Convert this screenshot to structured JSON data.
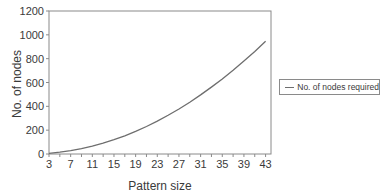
{
  "chart_data": {
    "type": "line",
    "title": "",
    "xlabel": "Pattern size",
    "ylabel": "No. of nodes",
    "x_tick_labels": [
      "3",
      "7",
      "11",
      "15",
      "19",
      "23",
      "27",
      "31",
      "35",
      "39",
      "43"
    ],
    "y_tick_labels": [
      "0",
      "200",
      "400",
      "600",
      "800",
      "1000",
      "1200"
    ],
    "xlim": [
      3,
      44
    ],
    "ylim": [
      0,
      1200
    ],
    "grid": false,
    "legend_position": "right",
    "series": [
      {
        "name": "No. of nodes required",
        "color": "#6e6e6e",
        "x": [
          3,
          5,
          7,
          9,
          11,
          13,
          15,
          17,
          19,
          21,
          23,
          25,
          27,
          29,
          31,
          33,
          35,
          37,
          39,
          41,
          43
        ],
        "values": [
          6,
          15,
          28,
          45,
          66,
          91,
          120,
          153,
          190,
          231,
          276,
          325,
          378,
          435,
          496,
          561,
          630,
          703,
          780,
          861,
          946
        ]
      }
    ]
  },
  "legend": {
    "label": "No. of nodes required"
  },
  "axes": {
    "xlabel": "Pattern size",
    "ylabel": "No. of nodes"
  }
}
